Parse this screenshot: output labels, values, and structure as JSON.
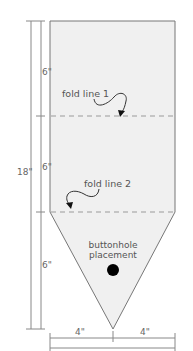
{
  "diagram": {
    "type": "sewing-pattern",
    "colors": {
      "fill": "#f0f0f0",
      "outline": "#777777",
      "fold_line": "#9a9a9a",
      "dimension_line": "#888888",
      "button_dot": "#000000",
      "text": "#555555"
    },
    "labels": {
      "fold_line_1": "fold line 1",
      "fold_line_2": "fold line 2",
      "buttonhole_line1": "buttonhole",
      "buttonhole_line2": "placement"
    },
    "dimensions": {
      "total_height": "18\"",
      "section_1_height": "6\"",
      "section_2_height": "6\"",
      "section_3_height": "6\"",
      "left_half_width": "4\"",
      "right_half_width": "4\"",
      "total_width": "8\""
    }
  }
}
